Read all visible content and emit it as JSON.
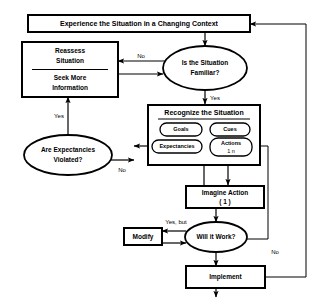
{
  "diagram": {
    "nodes": {
      "experience": {
        "label": "Experience the Situation in a Changing Context",
        "shape": "rectangle"
      },
      "reassess": {
        "label_line1": "Reassess",
        "label_line2": "Situation",
        "shape": "rectangle"
      },
      "seek_more": {
        "label_line1": "Seek More",
        "label_line2": "Information",
        "shape": "rectangle"
      },
      "is_familiar": {
        "label_line1": "Is the Situation",
        "label_line2": "Familiar?",
        "shape": "ellipse"
      },
      "recognize": {
        "label": "Recognize the Situation",
        "shape": "group"
      },
      "goals": {
        "label": "Goals",
        "shape": "pill"
      },
      "cues": {
        "label": "Cues",
        "shape": "pill"
      },
      "expectancies": {
        "label": "Expectancies",
        "shape": "pill"
      },
      "actions": {
        "label_line1": "Actions",
        "label_line2": "1    n",
        "shape": "pill"
      },
      "are_expectancies_violated": {
        "label_line1": "Are Expectancies",
        "label_line2": "Violated?",
        "shape": "ellipse"
      },
      "imagine_action": {
        "label_line1": "Imagine Action",
        "label_line2": "( 1 )",
        "shape": "rectangle"
      },
      "modify": {
        "label": "Modify",
        "shape": "rectangle"
      },
      "will_it_work": {
        "label": "Will it Work?",
        "shape": "ellipse"
      },
      "implement": {
        "label": "Implement",
        "shape": "rectangle"
      }
    },
    "edge_labels": {
      "familiar_no": "No",
      "familiar_yes": "Yes",
      "violated_yes": "Yes",
      "violated_no": "No",
      "work_yes_but": "Yes, but",
      "work_no": "No"
    },
    "colors": {
      "stroke": "#000000",
      "fill": "#ffffff"
    }
  }
}
